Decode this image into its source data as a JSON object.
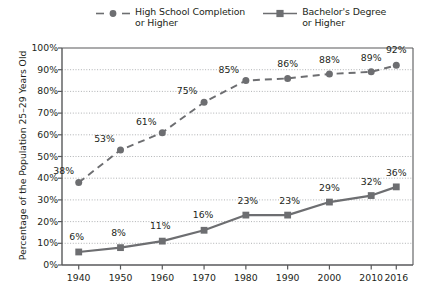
{
  "chart_data": {
    "type": "line",
    "title": "",
    "xlabel": "",
    "ylabel": "Percentage of the Population 25–29 Years Old",
    "categories": [
      "1940",
      "1950",
      "1960",
      "1970",
      "1980",
      "1990",
      "2000",
      "2010",
      "2016"
    ],
    "x": [
      1940,
      1950,
      1960,
      1970,
      1980,
      1990,
      2000,
      2010,
      2016
    ],
    "xlim": [
      1936,
      2020
    ],
    "ylim": [
      0,
      100
    ],
    "y_ticks": [
      "0%",
      "10%",
      "20%",
      "30%",
      "40%",
      "50%",
      "60%",
      "70%",
      "80%",
      "90%",
      "100%"
    ],
    "y_tick_values": [
      0,
      10,
      20,
      30,
      40,
      50,
      60,
      70,
      80,
      90,
      100
    ],
    "grid": true,
    "grid_style": "dotted-horizontal",
    "legend_position": "top-center",
    "series": [
      {
        "name": "High School Completion or Higher",
        "style": "dashed",
        "marker": "circle",
        "color": "#6d6e71",
        "values": [
          38,
          53,
          61,
          75,
          85,
          86,
          88,
          89,
          92
        ],
        "labels": [
          "38%",
          "53%",
          "61%",
          "75%",
          "85%",
          "86%",
          "88%",
          "89%",
          "92%"
        ]
      },
      {
        "name": "Bachelor's Degree or Higher",
        "style": "solid",
        "marker": "square",
        "color": "#6d6e71",
        "values": [
          6,
          8,
          11,
          16,
          23,
          23,
          29,
          32,
          36
        ],
        "labels": [
          "6%",
          "8%",
          "11%",
          "16%",
          "23%",
          "23%",
          "29%",
          "32%",
          "36%"
        ]
      }
    ]
  },
  "legend": {
    "entries": [
      {
        "label": "High School Completion\nor Higher",
        "style": "dashed",
        "marker": "circle"
      },
      {
        "label": "Bachelor's Degree\nor Higher",
        "style": "solid",
        "marker": "square"
      }
    ]
  },
  "colors": {
    "series": "#6d6e71",
    "axis": "#58595b",
    "grid": "#a7a9ac",
    "text": "#231f20",
    "background": "#ffffff"
  }
}
